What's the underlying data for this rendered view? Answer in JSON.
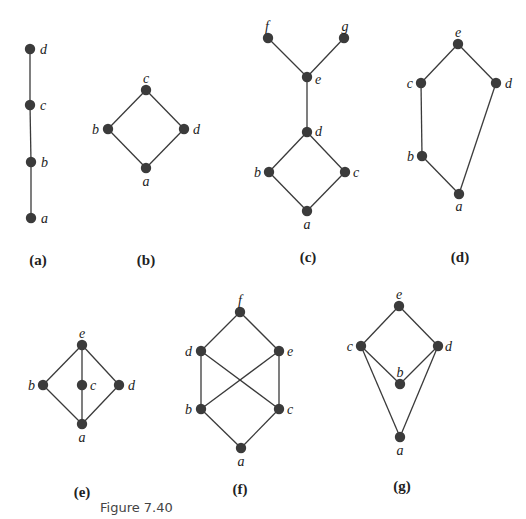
{
  "figure": {
    "caption": "Figure 7.40",
    "caption_pos": [
      100,
      512
    ],
    "colors": {
      "edge": "#3a3a3a",
      "node": "#3b3b3b",
      "text": "#222222"
    },
    "panels": [
      {
        "id": "a",
        "label": "(a)",
        "label_pos": [
          38,
          265
        ],
        "nodes": [
          {
            "name": "d",
            "x": 30,
            "y": 49,
            "lx": 40,
            "ly": 54,
            "anchor": "start"
          },
          {
            "name": "c",
            "x": 30,
            "y": 105,
            "lx": 40,
            "ly": 110,
            "anchor": "start"
          },
          {
            "name": "b",
            "x": 31,
            "y": 162,
            "lx": 41,
            "ly": 167,
            "anchor": "start"
          },
          {
            "name": "a",
            "x": 31,
            "y": 218,
            "lx": 41,
            "ly": 223,
            "anchor": "start"
          }
        ],
        "edges": [
          [
            "d",
            "c"
          ],
          [
            "c",
            "b"
          ],
          [
            "b",
            "a"
          ]
        ]
      },
      {
        "id": "b",
        "label": "(b)",
        "label_pos": [
          146,
          265
        ],
        "nodes": [
          {
            "name": "c",
            "x": 146,
            "y": 90,
            "lx": 146,
            "ly": 83,
            "anchor": "middle"
          },
          {
            "name": "b",
            "x": 108,
            "y": 129,
            "lx": 99,
            "ly": 134,
            "anchor": "end"
          },
          {
            "name": "d",
            "x": 184,
            "y": 129,
            "lx": 193,
            "ly": 134,
            "anchor": "start"
          },
          {
            "name": "a",
            "x": 146,
            "y": 168,
            "lx": 146,
            "ly": 186,
            "anchor": "middle"
          }
        ],
        "edges": [
          [
            "c",
            "b"
          ],
          [
            "c",
            "d"
          ],
          [
            "b",
            "a"
          ],
          [
            "d",
            "a"
          ]
        ]
      },
      {
        "id": "c",
        "label": "(c)",
        "label_pos": [
          308,
          262
        ],
        "nodes": [
          {
            "name": "f",
            "x": 268,
            "y": 38,
            "lx": 267,
            "ly": 31,
            "anchor": "middle"
          },
          {
            "name": "g",
            "x": 344,
            "y": 38,
            "lx": 345,
            "ly": 31,
            "anchor": "middle"
          },
          {
            "name": "e",
            "x": 307,
            "y": 77,
            "lx": 315,
            "ly": 84,
            "anchor": "start"
          },
          {
            "name": "d",
            "x": 307,
            "y": 132,
            "lx": 315,
            "ly": 136,
            "anchor": "start"
          },
          {
            "name": "b",
            "x": 269,
            "y": 172,
            "lx": 261,
            "ly": 177,
            "anchor": "end"
          },
          {
            "name": "c",
            "x": 345,
            "y": 172,
            "lx": 353,
            "ly": 177,
            "anchor": "start"
          },
          {
            "name": "a",
            "x": 307,
            "y": 211,
            "lx": 307,
            "ly": 229,
            "anchor": "middle"
          }
        ],
        "edges": [
          [
            "f",
            "e"
          ],
          [
            "g",
            "e"
          ],
          [
            "e",
            "d"
          ],
          [
            "d",
            "b"
          ],
          [
            "d",
            "c"
          ],
          [
            "b",
            "a"
          ],
          [
            "c",
            "a"
          ]
        ]
      },
      {
        "id": "d",
        "label": "(d)",
        "label_pos": [
          460,
          262
        ],
        "nodes": [
          {
            "name": "e",
            "x": 458,
            "y": 44,
            "lx": 458,
            "ly": 37,
            "anchor": "middle"
          },
          {
            "name": "c",
            "x": 421,
            "y": 83,
            "lx": 413,
            "ly": 88,
            "anchor": "end"
          },
          {
            "name": "d",
            "x": 496,
            "y": 83,
            "lx": 505,
            "ly": 88,
            "anchor": "start"
          },
          {
            "name": "b",
            "x": 422,
            "y": 156,
            "lx": 414,
            "ly": 161,
            "anchor": "end"
          },
          {
            "name": "a",
            "x": 459,
            "y": 194,
            "lx": 459,
            "ly": 211,
            "anchor": "middle"
          }
        ],
        "edges": [
          [
            "e",
            "c"
          ],
          [
            "e",
            "d"
          ],
          [
            "c",
            "b"
          ],
          [
            "b",
            "a"
          ],
          [
            "d",
            "a"
          ]
        ]
      },
      {
        "id": "e",
        "label": "(e)",
        "label_pos": [
          82,
          497
        ],
        "nodes": [
          {
            "name": "e",
            "x": 82,
            "y": 345,
            "lx": 82,
            "ly": 338,
            "anchor": "middle"
          },
          {
            "name": "b",
            "x": 43,
            "y": 385,
            "lx": 35,
            "ly": 390,
            "anchor": "end"
          },
          {
            "name": "c",
            "x": 82,
            "y": 385,
            "lx": 90,
            "ly": 390,
            "anchor": "start"
          },
          {
            "name": "d",
            "x": 119,
            "y": 385,
            "lx": 128,
            "ly": 390,
            "anchor": "start"
          },
          {
            "name": "a",
            "x": 82,
            "y": 424,
            "lx": 82,
            "ly": 442,
            "anchor": "middle"
          }
        ],
        "edges": [
          [
            "e",
            "b"
          ],
          [
            "e",
            "c"
          ],
          [
            "e",
            "d"
          ],
          [
            "b",
            "a"
          ],
          [
            "c",
            "a"
          ],
          [
            "d",
            "a"
          ]
        ]
      },
      {
        "id": "f",
        "label": "(f)",
        "label_pos": [
          240,
          494
        ],
        "nodes": [
          {
            "name": "f",
            "x": 240,
            "y": 312,
            "lx": 240,
            "ly": 305,
            "anchor": "middle"
          },
          {
            "name": "d",
            "x": 201,
            "y": 351,
            "lx": 192,
            "ly": 356,
            "anchor": "end"
          },
          {
            "name": "e",
            "x": 279,
            "y": 351,
            "lx": 287,
            "ly": 356,
            "anchor": "start"
          },
          {
            "name": "b",
            "x": 201,
            "y": 409,
            "lx": 192,
            "ly": 414,
            "anchor": "end"
          },
          {
            "name": "c",
            "x": 279,
            "y": 409,
            "lx": 287,
            "ly": 414,
            "anchor": "start"
          },
          {
            "name": "a",
            "x": 241,
            "y": 448,
            "lx": 241,
            "ly": 466,
            "anchor": "middle"
          }
        ],
        "edges": [
          [
            "f",
            "d"
          ],
          [
            "f",
            "e"
          ],
          [
            "d",
            "b"
          ],
          [
            "d",
            "c"
          ],
          [
            "e",
            "b"
          ],
          [
            "e",
            "c"
          ],
          [
            "b",
            "a"
          ],
          [
            "c",
            "a"
          ]
        ]
      },
      {
        "id": "g",
        "label": "(g)",
        "label_pos": [
          402,
          491
        ],
        "nodes": [
          {
            "name": "e",
            "x": 399,
            "y": 306,
            "lx": 399,
            "ly": 299,
            "anchor": "middle"
          },
          {
            "name": "c",
            "x": 361,
            "y": 346,
            "lx": 353,
            "ly": 351,
            "anchor": "end"
          },
          {
            "name": "d",
            "x": 438,
            "y": 346,
            "lx": 445,
            "ly": 351,
            "anchor": "start"
          },
          {
            "name": "b",
            "x": 400,
            "y": 384,
            "lx": 400,
            "ly": 377,
            "anchor": "middle"
          },
          {
            "name": "a",
            "x": 400,
            "y": 437,
            "lx": 400,
            "ly": 455,
            "anchor": "middle"
          }
        ],
        "edges": [
          [
            "e",
            "c"
          ],
          [
            "e",
            "d"
          ],
          [
            "c",
            "b"
          ],
          [
            "d",
            "b"
          ],
          [
            "c",
            "a"
          ],
          [
            "d",
            "a"
          ]
        ]
      }
    ]
  }
}
